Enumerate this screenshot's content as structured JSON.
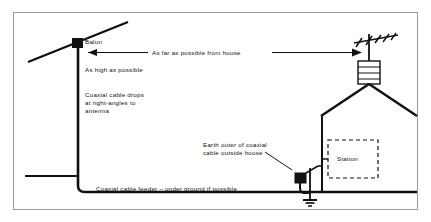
{
  "figure": {
    "kind": "antenna-installation-diagram",
    "border_color": "#999999",
    "ink_color": "#111111"
  },
  "labels": {
    "balun": "Balun",
    "as_far_as_possible": "As far as possible from house",
    "as_high_as_possible": "As high as possible",
    "coax_drops_line1": "Coaxial cable drops",
    "coax_drops_line2": "at right-angles to",
    "coax_drops_line3": "antenna",
    "earth_outer_line1": "Earth outer of coaxial",
    "earth_outer_line2": "cable outside house",
    "station": "Station",
    "feeder": "Coaxial cable feeder – under ground if possible"
  },
  "icons": {
    "balun": "balun-dot-icon",
    "yagi": "tv-antenna-icon",
    "chimney": "chimney-icon",
    "house": "house-roof-icon",
    "earth": "earth-ground-icon",
    "station": "station-box-icon",
    "arrow_left": "arrow-left-icon",
    "arrow_right": "arrow-right-icon"
  }
}
